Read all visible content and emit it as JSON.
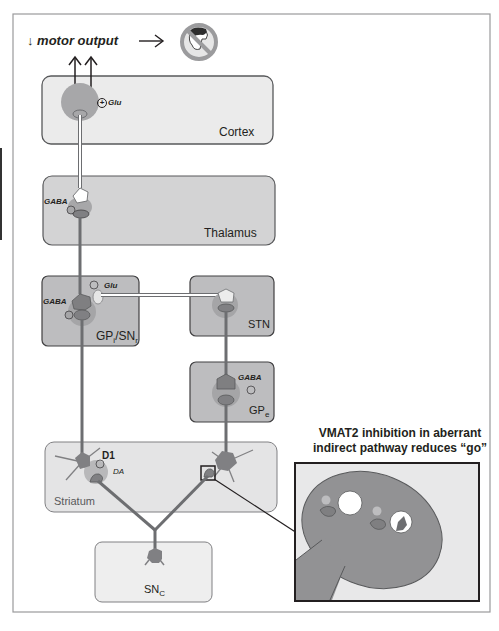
{
  "header": {
    "motor_output_label": "↓ motor output",
    "arrow_label": "→",
    "no_movement_icon": "no-movement-icon"
  },
  "regions": {
    "cortex": "Cortex",
    "thalamus": "Thalamus",
    "gpi_snr": {
      "main": "GP",
      "sub1": "i",
      "mid": "/SN",
      "sub2": "r"
    },
    "stn": "STN",
    "gpe": {
      "main": "GP",
      "sub": "e"
    },
    "striatum": "Striatum",
    "snc": {
      "main": "SN",
      "sub": "C"
    }
  },
  "neurotransmitters": {
    "cortex_glu": "Glu",
    "thalamus_gaba": "GABA",
    "gpi_glu": "Glu",
    "gpi_gaba": "GABA",
    "gpe_gaba": "GABA",
    "striatum_d1": "D1",
    "striatum_da": "DA"
  },
  "signs": {
    "plus": "+",
    "minus": "−"
  },
  "callout": {
    "line1": "VMAT2 inhibition in aberrant",
    "line2": "indirect pathway reduces “go”"
  },
  "colors": {
    "region_fill": "#e9e9e9",
    "region_dark_fill": "#bcbcbc",
    "region_stroke": "#6d6e71",
    "neuron": "#8a8a8c",
    "axon": "#7b7b7d",
    "axon_light": "#ffffff",
    "halo": "#b1b1b3",
    "text": "#231f20"
  }
}
